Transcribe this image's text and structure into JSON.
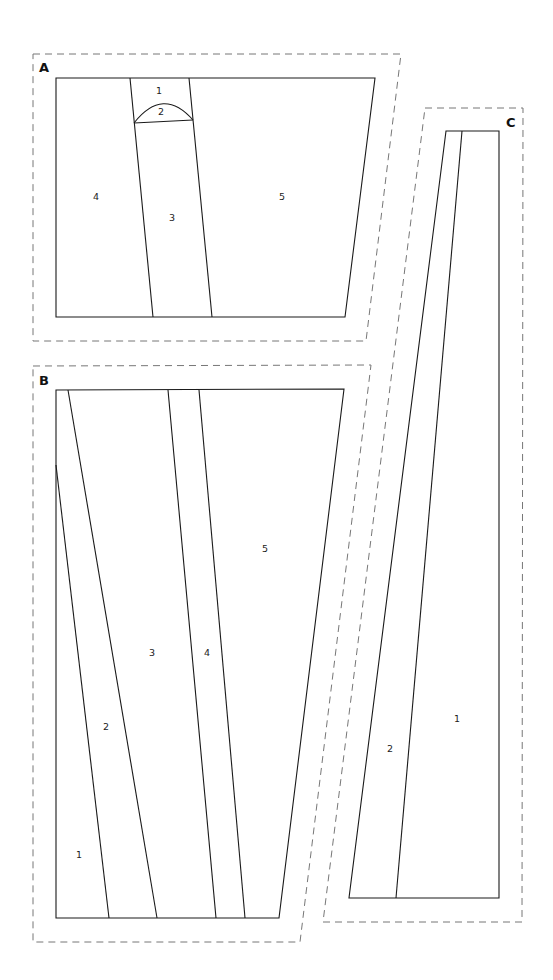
{
  "diagram": {
    "colors": {
      "line": "#1a1a1a",
      "dashed": "#777777",
      "background": "#ffffff"
    },
    "sections": [
      {
        "id": "A",
        "label": "A",
        "label_pos": [
          39,
          72
        ],
        "seam_allowance": [
          [
            33,
            54
          ],
          [
            401,
            54
          ],
          [
            366,
            341
          ],
          [
            33,
            341
          ]
        ],
        "outline": [
          [
            56,
            78
          ],
          [
            375,
            78
          ],
          [
            345,
            317
          ],
          [
            56,
            317
          ]
        ],
        "lines": [
          [
            [
              130,
              78
            ],
            [
              153,
              317
            ]
          ],
          [
            [
              189,
              78
            ],
            [
              212,
              317
            ]
          ],
          [
            [
              134,
              123
            ],
            [
              193,
              120
            ]
          ]
        ],
        "arcs": [
          {
            "d": "M134,123 Q163,86 193,120"
          }
        ],
        "pieces": [
          {
            "label": "1",
            "pos": [
              159,
              91
            ]
          },
          {
            "label": "2",
            "pos": [
              161,
              112
            ]
          },
          {
            "label": "3",
            "pos": [
              172,
              218
            ]
          },
          {
            "label": "4",
            "pos": [
              96,
              197
            ]
          },
          {
            "label": "5",
            "pos": [
              282,
              197
            ]
          }
        ]
      },
      {
        "id": "B",
        "label": "B",
        "label_pos": [
          39,
          385
        ],
        "seam_allowance": [
          [
            33,
            366
          ],
          [
            371,
            365
          ],
          [
            300,
            942
          ],
          [
            33,
            942
          ]
        ],
        "outline": [
          [
            56,
            390
          ],
          [
            344,
            389
          ],
          [
            279,
            918
          ],
          [
            56,
            918
          ]
        ],
        "lines": [
          [
            [
              56,
              465
            ],
            [
              109,
              918
            ]
          ],
          [
            [
              68,
              390
            ],
            [
              157,
              918
            ]
          ],
          [
            [
              168,
              390
            ],
            [
              216,
              918
            ]
          ],
          [
            [
              199,
              390
            ],
            [
              245,
              918
            ]
          ]
        ],
        "arcs": [],
        "pieces": [
          {
            "label": "1",
            "pos": [
              79,
              855
            ]
          },
          {
            "label": "2",
            "pos": [
              106,
              727
            ]
          },
          {
            "label": "3",
            "pos": [
              152,
              653
            ]
          },
          {
            "label": "4",
            "pos": [
              207,
              653
            ]
          },
          {
            "label": "5",
            "pos": [
              265,
              549
            ]
          }
        ]
      },
      {
        "id": "C",
        "label": "C",
        "label_pos": [
          506,
          127
        ],
        "seam_allowance": [
          [
            425,
            108
          ],
          [
            523,
            108
          ],
          [
            522,
            922
          ],
          [
            323,
            922
          ]
        ],
        "outline": [
          [
            446,
            131
          ],
          [
            499,
            131
          ],
          [
            499,
            898
          ],
          [
            349,
            898
          ]
        ],
        "lines": [
          [
            [
              462,
              131
            ],
            [
              396,
              898
            ]
          ]
        ],
        "arcs": [],
        "pieces": [
          {
            "label": "1",
            "pos": [
              457,
              719
            ]
          },
          {
            "label": "2",
            "pos": [
              390,
              749
            ]
          }
        ]
      }
    ]
  }
}
